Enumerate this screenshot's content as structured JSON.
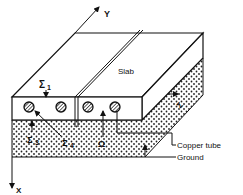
{
  "diagram": {
    "axes": {
      "y_label": "Y",
      "x_label": "X"
    },
    "labels": {
      "slab": "Slab",
      "sigma1": "Σ",
      "sigma1_sub": "1",
      "sigma2": "Σ",
      "sigma2_sub": "2",
      "sigma3": "Σ",
      "sigma3_sub": "3",
      "sigma4": "Σ",
      "sigma4_sub": "4",
      "omega": "Ω",
      "copper_tube": "Copper tube",
      "ground": "Ground"
    },
    "tube_count": 4,
    "colors": {
      "line": "#111111",
      "background": "#ffffff",
      "ground_dots": "#222222"
    }
  }
}
